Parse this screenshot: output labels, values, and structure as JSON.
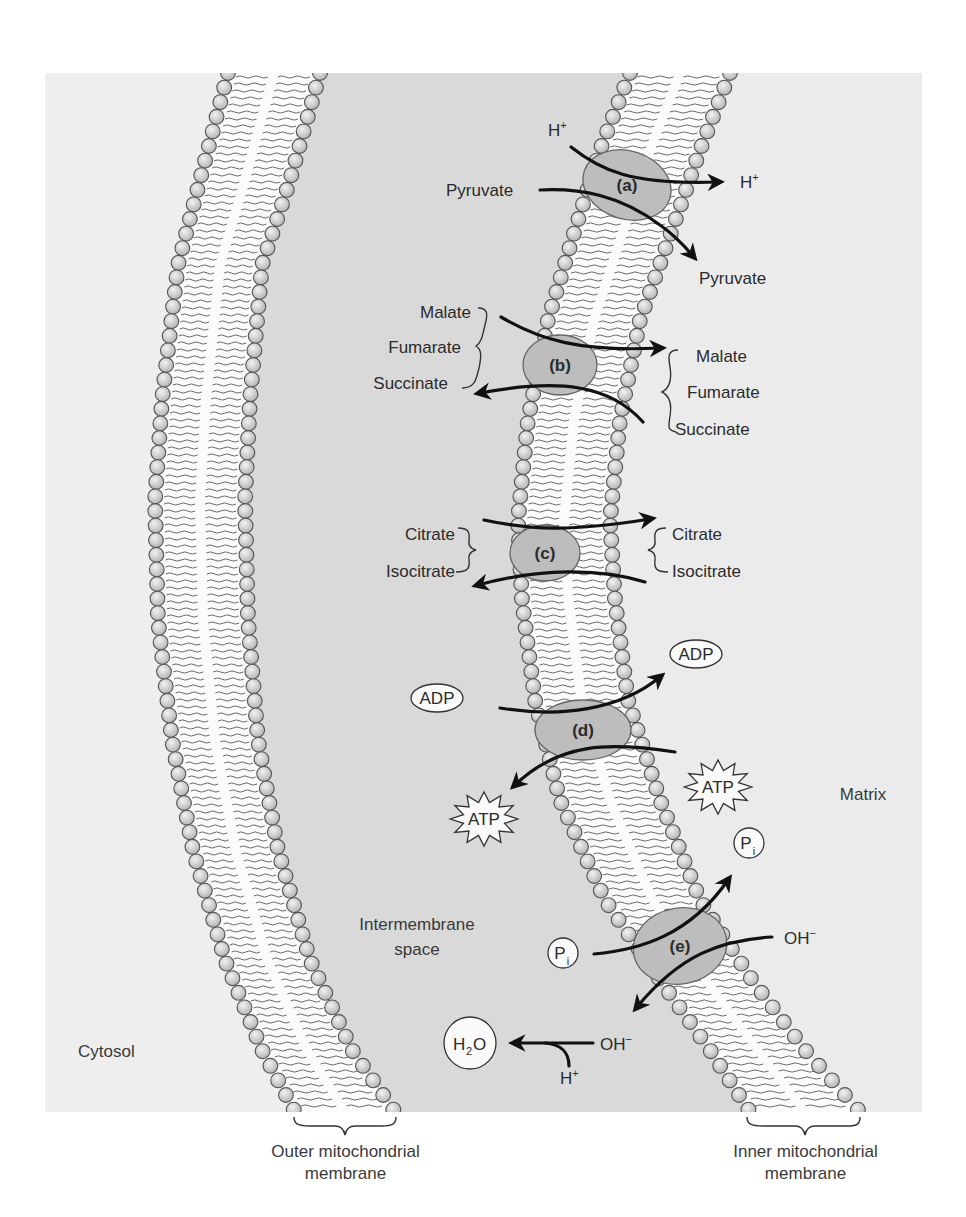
{
  "colors": {
    "page_bg": "#ffffff",
    "cytosol": "#eeeeee",
    "intermembrane": "#d9d9d9",
    "matrix": "#ebebeb",
    "bilayer_core": "#fbfbfb",
    "headgroup_fill": "#cfcfcf",
    "headgroup_stroke": "#555555",
    "tail": "#6a6a6a",
    "protein_fill": "#bdbdbd",
    "protein_stroke": "#666666",
    "arrow": "#111111",
    "text": "#2b2b2b"
  },
  "frame": {
    "x": 45,
    "y": 73,
    "width": 877,
    "height": 1039
  },
  "regions": {
    "cytosol": {
      "label": "Cytosol",
      "x": 78,
      "y": 1057
    },
    "intermembrane": {
      "label_line1": "Intermembrane",
      "label_line2": "space",
      "x": 417,
      "y": 930
    },
    "matrix": {
      "label": "Matrix",
      "x": 863,
      "y": 800
    }
  },
  "membranes": {
    "outer": {
      "label_line1": "Outer mitochondrial",
      "label_line2": "membrane",
      "left_edge": [
        [
          228,
          73
        ],
        [
          200,
          180
        ],
        [
          178,
          265
        ],
        [
          162,
          400
        ],
        [
          155,
          500
        ],
        [
          158,
          620
        ],
        [
          172,
          740
        ],
        [
          193,
          850
        ],
        [
          225,
          960
        ],
        [
          262,
          1050
        ],
        [
          295,
          1112
        ]
      ],
      "right_edge": [
        [
          320,
          73
        ],
        [
          290,
          180
        ],
        [
          262,
          265
        ],
        [
          250,
          400
        ],
        [
          245,
          500
        ],
        [
          248,
          620
        ],
        [
          258,
          740
        ],
        [
          278,
          850
        ],
        [
          310,
          960
        ],
        [
          352,
          1050
        ],
        [
          395,
          1112
        ]
      ]
    },
    "inner": {
      "label_line1": "Inner mitochondrial",
      "label_line2": "membrane",
      "left_edge": [
        [
          630,
          73
        ],
        [
          600,
          150
        ],
        [
          575,
          230
        ],
        [
          548,
          320
        ],
        [
          528,
          420
        ],
        [
          518,
          520
        ],
        [
          522,
          600
        ],
        [
          535,
          700
        ],
        [
          560,
          800
        ],
        [
          605,
          900
        ],
        [
          660,
          980
        ],
        [
          710,
          1050
        ],
        [
          750,
          1112
        ]
      ],
      "right_edge": [
        [
          730,
          73
        ],
        [
          700,
          150
        ],
        [
          672,
          230
        ],
        [
          640,
          320
        ],
        [
          620,
          420
        ],
        [
          610,
          520
        ],
        [
          615,
          600
        ],
        [
          628,
          700
        ],
        [
          660,
          800
        ],
        [
          700,
          900
        ],
        [
          752,
          980
        ],
        [
          805,
          1050
        ],
        [
          860,
          1112
        ]
      ]
    }
  },
  "transporters": [
    {
      "id": "a",
      "label": "(a)",
      "cx": 627,
      "cy": 185,
      "rx": 45,
      "ry": 34,
      "rotate": 18,
      "left_items": [
        "Pyruvate"
      ],
      "right_items": [
        "H⁺",
        "Pyruvate"
      ],
      "extra_labels": [
        {
          "text": "H",
          "sup": "+",
          "x": 548,
          "y": 131
        },
        {
          "text": "Pyruvate",
          "sup": "",
          "x": 446,
          "y": 196
        },
        {
          "text": "H",
          "sup": "+",
          "x": 740,
          "y": 188
        },
        {
          "text": "Pyruvate",
          "sup": "",
          "x": 699,
          "y": 284
        }
      ]
    },
    {
      "id": "b",
      "label": "(b)",
      "cx": 560,
      "cy": 365,
      "rx": 37,
      "ry": 30,
      "rotate": 0,
      "left_items": [
        "Malate",
        "Fumarate",
        "Succinate"
      ],
      "right_items": [
        "Malate",
        "Fumarate",
        "Succinate"
      ],
      "extra_labels": []
    },
    {
      "id": "c",
      "label": "(c)",
      "cx": 545,
      "cy": 553,
      "rx": 35,
      "ry": 28,
      "rotate": 0,
      "left_items": [
        "Citrate",
        "Isocitrate"
      ],
      "right_items": [
        "Citrate",
        "Isocitrate"
      ],
      "extra_labels": []
    },
    {
      "id": "d",
      "label": "(d)",
      "cx": 583,
      "cy": 730,
      "rx": 48,
      "ry": 30,
      "rotate": 0,
      "left_items": [
        "ADP",
        "ATP"
      ],
      "right_items": [
        "ADP",
        "ATP"
      ],
      "extra_labels": []
    },
    {
      "id": "e",
      "label": "(e)",
      "cx": 680,
      "cy": 946,
      "rx": 47,
      "ry": 38,
      "rotate": -10,
      "left_items": [
        "Pᵢ",
        "H₂O"
      ],
      "right_items": [
        "Pᵢ",
        "OH⁻"
      ],
      "extra_labels": []
    }
  ],
  "labels": {
    "a_h_in": "H",
    "a_h_out": "H",
    "plus": "+",
    "minus": "−",
    "a_pyruvate_in": "Pyruvate",
    "a_pyruvate_out": "Pyruvate",
    "b_left": [
      "Malate",
      "Fumarate",
      "Succinate"
    ],
    "b_right": [
      "Malate",
      "Fumarate",
      "Succinate"
    ],
    "c_left": [
      "Citrate",
      "Isocitrate"
    ],
    "c_right": [
      "Citrate",
      "Isocitrate"
    ],
    "d_adp_left": "ADP",
    "d_adp_right": "ADP",
    "d_atp_left": "ATP",
    "d_atp_right": "ATP",
    "e_pi_left": "P",
    "e_pi_right": "P",
    "e_pi_sub": "i",
    "e_oh_right": "OH",
    "e_oh_left": "OH",
    "h2o_h": "H",
    "h2o_sub": "2",
    "h2o_o": "O",
    "e_h_plus": "H"
  }
}
